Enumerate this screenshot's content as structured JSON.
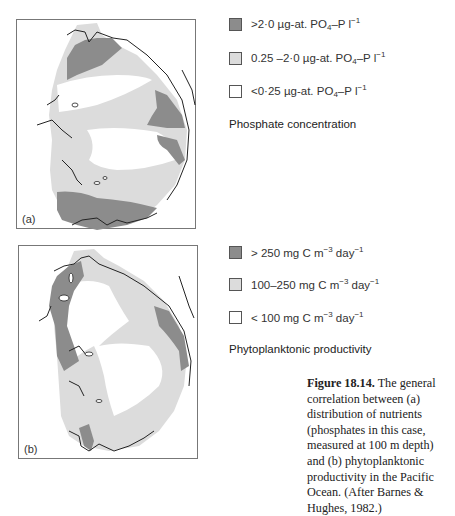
{
  "figure": {
    "number": "Figure 18.14.",
    "caption": "The general correlation between (a) distribution of nutrients (phosphates in this case, measured at 100 m depth) and (b) phytoplanktonic productivity in the Pacific Ocean. (After Barnes & Hughes, 1982.)"
  },
  "colors": {
    "high": "#8c8c8c",
    "medium": "#dcdcdc",
    "low": "#ffffff",
    "coast": "#222222",
    "frame": "#777777"
  },
  "panel_a": {
    "label": "(a)",
    "legend_title": "Phosphate concentration",
    "legend": [
      {
        "level": "high",
        "prefix": ">2·0 µg-at. PO",
        "sub": "4",
        "mid": "–P l",
        "sup": "−1"
      },
      {
        "level": "medium",
        "prefix": "0.25 –2·0 µg-at. PO",
        "sub": "4",
        "mid": "–P l",
        "sup": "−1"
      },
      {
        "level": "low",
        "prefix": "<0·25 µg-at. PO",
        "sub": "4",
        "mid": "–P l",
        "sup": "−1"
      }
    ]
  },
  "panel_b": {
    "label": "(b)",
    "legend_title": "Phytoplanktonic productivity",
    "legend": [
      {
        "level": "high",
        "prefix": "> 250 mg C m",
        "sup1": "−3",
        "mid": " day",
        "sup2": "−1"
      },
      {
        "level": "medium",
        "prefix": "100–250 mg C m",
        "sup1": "−3",
        "mid": " day",
        "sup2": "−1"
      },
      {
        "level": "low",
        "prefix": "< 100 mg C m",
        "sup1": "−3",
        "mid": " day",
        "sup2": "−1"
      }
    ]
  }
}
